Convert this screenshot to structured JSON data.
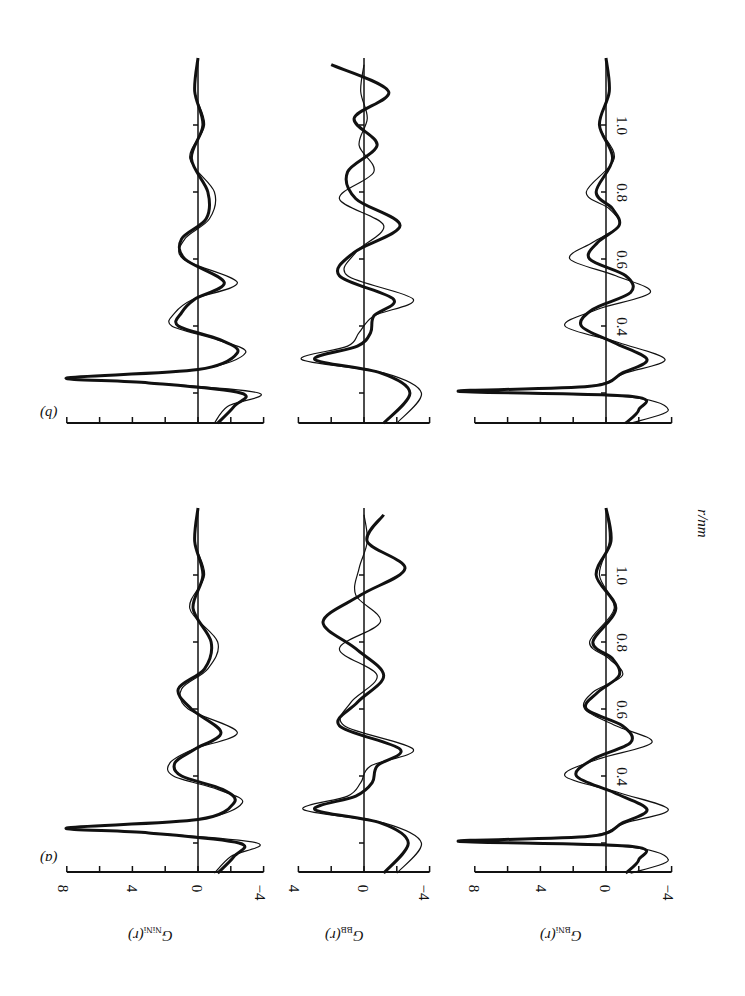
{
  "figure": {
    "panel_labels": [
      "(a)",
      "(b)"
    ],
    "r_axis_label": "r/nm",
    "column_labels": [
      {
        "main": "G",
        "sub": "NiNi",
        "arg": "(r)"
      },
      {
        "main": "G",
        "sub": "BB",
        "arg": "(r)"
      },
      {
        "main": "G",
        "sub": "BNi",
        "arg": "(r)"
      }
    ],
    "value_tick_labels": {
      "NiNi": [
        "8",
        "4",
        "0",
        "−4"
      ],
      "BB": [
        "4",
        "0",
        "−4"
      ],
      "BNi": [
        "8",
        "4",
        "0",
        "−4"
      ]
    },
    "r_tick_labels": [
      "0.4",
      "0.6",
      "0.8",
      "1.0"
    ]
  },
  "chart_data": [
    {
      "type": "line",
      "panel": "(a)",
      "title": "G_NiNi(r)",
      "xlabel": "r/nm",
      "ylabel": "G_NiNi(r)",
      "ylim": [
        -4,
        8
      ],
      "xlim": [
        0.11,
        1.2
      ],
      "series": [
        {
          "name": "model (thick)",
          "x": [
            0.11,
            0.16,
            0.2,
            0.23,
            0.245,
            0.27,
            0.32,
            0.36,
            0.4,
            0.44,
            0.48,
            0.53,
            0.6,
            0.66,
            0.72,
            0.8,
            0.9,
            1.0,
            1.1,
            1.2
          ],
          "values": [
            -1.2,
            -2.2,
            -2.5,
            3,
            8,
            0,
            -2.2,
            -1.5,
            1,
            1.4,
            0.2,
            -1.4,
            0.4,
            1.2,
            -0.4,
            -0.8,
            0.3,
            -0.3,
            0.2,
            0
          ]
        },
        {
          "name": "experiment (thin)",
          "x": [
            0.11,
            0.16,
            0.2,
            0.23,
            0.245,
            0.27,
            0.32,
            0.36,
            0.4,
            0.44,
            0.48,
            0.53,
            0.6,
            0.66,
            0.72,
            0.8,
            0.9,
            1.0,
            1.1,
            1.2
          ],
          "values": [
            -1.0,
            -2.0,
            -3.6,
            3,
            7.8,
            0,
            -2.7,
            -1.2,
            1.5,
            1.7,
            0.3,
            -2.4,
            0.6,
            1.0,
            -0.6,
            -1.2,
            0.5,
            -0.4,
            0.2,
            0
          ]
        }
      ]
    },
    {
      "type": "line",
      "panel": "(a)",
      "title": "G_BB(r)",
      "xlabel": "r/nm",
      "ylabel": "G_BB(r)",
      "ylim": [
        -4,
        4
      ],
      "xlim": [
        0.11,
        1.2
      ],
      "series": [
        {
          "name": "model (thick)",
          "x": [
            0.11,
            0.2,
            0.26,
            0.3,
            0.34,
            0.38,
            0.43,
            0.48,
            0.55,
            0.62,
            0.7,
            0.78,
            0.86,
            0.94,
            1.02,
            1.1,
            1.18
          ],
          "values": [
            -1.2,
            -2.7,
            -1,
            3,
            0.5,
            -0.5,
            -0.8,
            -2.2,
            1.5,
            0.4,
            -1.2,
            0.5,
            2.5,
            0.2,
            -2.5,
            -0.2,
            -1.2
          ]
        },
        {
          "name": "experiment (thin)",
          "x": [
            0.11,
            0.2,
            0.26,
            0.3,
            0.34,
            0.38,
            0.43,
            0.48,
            0.55,
            0.62,
            0.7,
            0.78,
            0.86,
            0.94,
            1.02,
            1.1,
            1.18
          ],
          "values": [
            -2,
            -3.5,
            -1.2,
            3.7,
            1,
            0.2,
            -0.4,
            -3,
            1.2,
            0.8,
            -0.8,
            1.5,
            -1,
            0.5,
            0.3,
            -0.2,
            0
          ]
        }
      ]
    },
    {
      "type": "line",
      "panel": "(a)",
      "title": "G_BNi(r)",
      "xlabel": "r/nm",
      "ylabel": "G_BNi(r)",
      "ylim": [
        -4,
        8
      ],
      "xlim": [
        0.11,
        1.2
      ],
      "series": [
        {
          "name": "model (thick)",
          "x": [
            0.11,
            0.15,
            0.19,
            0.205,
            0.22,
            0.26,
            0.3,
            0.35,
            0.4,
            0.45,
            0.5,
            0.55,
            0.6,
            0.65,
            0.7,
            0.75,
            0.8,
            0.9,
            1.0,
            1.1,
            1.2
          ],
          "values": [
            -1.2,
            -2,
            -1.5,
            9,
            1,
            -1,
            -2.5,
            -0.5,
            1.8,
            0.8,
            -1.5,
            -1,
            1.2,
            0.5,
            -0.8,
            -0.4,
            0.8,
            -0.6,
            0.6,
            -0.3,
            0
          ]
        },
        {
          "name": "experiment (thin)",
          "x": [
            0.11,
            0.15,
            0.19,
            0.205,
            0.22,
            0.26,
            0.3,
            0.35,
            0.4,
            0.45,
            0.5,
            0.55,
            0.6,
            0.65,
            0.7,
            0.75,
            0.8,
            0.9,
            1.0,
            1.1,
            1.2
          ],
          "values": [
            -1.5,
            -3.8,
            -1,
            8.8,
            1.2,
            -1.2,
            -3.8,
            -0.8,
            2.5,
            0.5,
            -2.8,
            -0.6,
            1.3,
            0.8,
            -1.0,
            -0.2,
            1.0,
            -0.5,
            0.4,
            -0.2,
            0
          ]
        }
      ]
    },
    {
      "type": "line",
      "panel": "(b)",
      "title": "G_NiNi(r)",
      "xlabel": "r/nm",
      "ylabel": "G_NiNi(r)",
      "ylim": [
        -4,
        8
      ],
      "xlim": [
        0.11,
        1.2
      ],
      "series": [
        {
          "name": "model (thick)",
          "x": [
            0.11,
            0.16,
            0.2,
            0.23,
            0.245,
            0.27,
            0.32,
            0.36,
            0.4,
            0.44,
            0.48,
            0.53,
            0.6,
            0.66,
            0.72,
            0.8,
            0.9,
            1.0,
            1.1,
            1.2
          ],
          "values": [
            -1.2,
            -2.2,
            -2.6,
            3,
            8,
            0,
            -2.4,
            -1.3,
            1.2,
            1.0,
            0.2,
            -1.6,
            0.8,
            1.0,
            -0.5,
            -0.6,
            0.4,
            -0.3,
            0.2,
            0
          ]
        },
        {
          "name": "experiment (thin)",
          "x": [
            0.11,
            0.16,
            0.2,
            0.23,
            0.245,
            0.27,
            0.32,
            0.36,
            0.4,
            0.44,
            0.48,
            0.53,
            0.6,
            0.66,
            0.72,
            0.8,
            0.9,
            1.0,
            1.1,
            1.2
          ],
          "values": [
            -1.0,
            -1.8,
            -3.7,
            3,
            7.8,
            0,
            -2.9,
            -1.1,
            1.6,
            1.4,
            0.3,
            -2.4,
            0.9,
            0.8,
            -0.7,
            -1.0,
            0.5,
            -0.4,
            0.2,
            0
          ]
        }
      ]
    },
    {
      "type": "line",
      "panel": "(b)",
      "title": "G_BB(r)",
      "xlabel": "r/nm",
      "ylabel": "G_BB(r)",
      "ylim": [
        -4,
        4
      ],
      "xlim": [
        0.11,
        1.2
      ],
      "series": [
        {
          "name": "model (thick)",
          "x": [
            0.11,
            0.2,
            0.26,
            0.3,
            0.34,
            0.38,
            0.43,
            0.48,
            0.55,
            0.62,
            0.7,
            0.78,
            0.86,
            0.94,
            1.02,
            1.1,
            1.18
          ],
          "values": [
            -1.2,
            -2.8,
            -1,
            3,
            0.4,
            -0.4,
            -0.6,
            -1.8,
            1.5,
            0.6,
            -2.2,
            0.5,
            1.0,
            -0.8,
            0.6,
            -1.5,
            2.0
          ]
        },
        {
          "name": "experiment (thin)",
          "x": [
            0.11,
            0.2,
            0.26,
            0.3,
            0.34,
            0.38,
            0.43,
            0.48,
            0.55,
            0.62,
            0.7,
            0.78,
            0.86,
            0.94,
            1.02,
            1.1,
            1.18
          ],
          "values": [
            -2,
            -3.5,
            -1.2,
            3.8,
            1,
            0.3,
            -0.6,
            -3,
            1.0,
            0.5,
            -1.2,
            1.5,
            -0.6,
            0.3,
            -0.2,
            0.2,
            0
          ]
        }
      ]
    },
    {
      "type": "line",
      "panel": "(b)",
      "title": "G_BNi(r)",
      "xlabel": "r/nm",
      "ylabel": "G_BNi(r)",
      "ylim": [
        -4,
        8
      ],
      "xlim": [
        0.11,
        1.2
      ],
      "series": [
        {
          "name": "model (thick)",
          "x": [
            0.11,
            0.15,
            0.19,
            0.205,
            0.22,
            0.26,
            0.3,
            0.35,
            0.4,
            0.45,
            0.5,
            0.55,
            0.6,
            0.65,
            0.7,
            0.75,
            0.8,
            0.9,
            1.0,
            1.1,
            1.2
          ],
          "values": [
            -1.2,
            -2,
            -1.5,
            9,
            1,
            -1,
            -2.5,
            -0.5,
            1.5,
            0.8,
            -1.5,
            -1.2,
            1.0,
            0.5,
            -0.8,
            -0.4,
            0.6,
            -0.4,
            0.4,
            -0.2,
            0
          ]
        },
        {
          "name": "experiment (thin)",
          "x": [
            0.11,
            0.15,
            0.19,
            0.205,
            0.22,
            0.26,
            0.3,
            0.35,
            0.4,
            0.45,
            0.5,
            0.55,
            0.6,
            0.65,
            0.7,
            0.75,
            0.8,
            0.9,
            1.0,
            1.1,
            1.2
          ],
          "values": [
            -1.5,
            -3.8,
            -1,
            8.8,
            1.2,
            -1.2,
            -3.6,
            -0.8,
            2.5,
            0.5,
            -2.7,
            -0.6,
            2.2,
            0.8,
            -0.8,
            -0.2,
            1.2,
            -0.5,
            0.4,
            -0.2,
            0
          ]
        }
      ]
    }
  ]
}
